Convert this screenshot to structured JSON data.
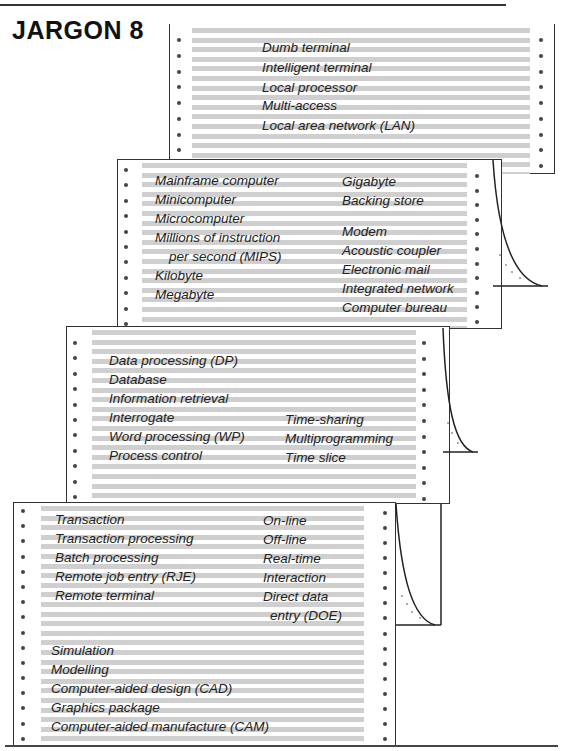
{
  "page": {
    "title": "JARGON 8"
  },
  "sheets": [
    {
      "id": "sheet-1",
      "terms_left": [
        "Dumb terminal",
        "Intelligent terminal",
        "Local processor",
        "Multi-access",
        "Local area network (LAN)"
      ]
    },
    {
      "id": "sheet-2",
      "terms_left": [
        "Mainframe computer",
        "Minicomputer",
        "Microcomputer",
        "Millions of instruction",
        "per second (MIPS)",
        "Kilobyte",
        "Megabyte"
      ],
      "terms_right": [
        "Gigabyte",
        "Backing store",
        "Modem",
        "Acoustic coupler",
        "Electronic mail",
        "Integrated network",
        "Computer bureau"
      ]
    },
    {
      "id": "sheet-3",
      "terms_left": [
        "Data processing (DP)",
        "Database",
        "Information retrieval",
        "Interrogate",
        "Word processing (WP)",
        "Process control"
      ],
      "terms_right": [
        "Time-sharing",
        "Multiprogramming",
        "Time slice"
      ]
    },
    {
      "id": "sheet-4",
      "terms_left": [
        "Transaction",
        "Transaction processing",
        "Batch processing",
        "Remote job entry (RJE)",
        "Remote terminal"
      ],
      "terms_right": [
        "On-line",
        "Off-line",
        "Real-time",
        "Interaction",
        "Direct data",
        "entry (DOE)"
      ],
      "terms_bottom": [
        "Simulation",
        "Modelling",
        "Computer-aided design (CAD)",
        "Graphics package",
        "Computer-aided manufacture (CAM)"
      ]
    }
  ],
  "colors": {
    "stripe": "#cfcfcf",
    "ink": "#222222",
    "border": "#333333"
  }
}
